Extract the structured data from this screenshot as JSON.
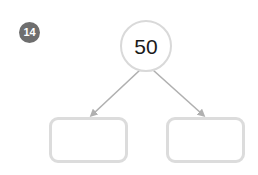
{
  "worksheet": {
    "background_color": "#ffffff",
    "question_badge": {
      "label": "14",
      "background_color": "#6e6e6e",
      "text_color": "#ffffff"
    }
  },
  "diagram": {
    "type": "number-bond",
    "accent_color": "#d9d9d9",
    "root_node": {
      "shape": "circle",
      "value": "50",
      "text_color": "#1a1a1a",
      "border_color": "#d9d9d9",
      "fill_color": "#ffffff"
    },
    "connectors": [
      {
        "name": "arrow-to-left-box",
        "from": "root_node",
        "to": "left_box",
        "color": "#b0b0b0",
        "arrowhead": true
      },
      {
        "name": "arrow-to-right-box",
        "from": "root_node",
        "to": "right_box",
        "color": "#b0b0b0",
        "arrowhead": true
      }
    ],
    "child_nodes": [
      {
        "name": "left_box",
        "shape": "rounded-rectangle",
        "value": "",
        "border_color": "#dcdcdc",
        "fill_color": "#ffffff"
      },
      {
        "name": "right_box",
        "shape": "rounded-rectangle",
        "value": "",
        "border_color": "#dcdcdc",
        "fill_color": "#ffffff"
      }
    ]
  }
}
